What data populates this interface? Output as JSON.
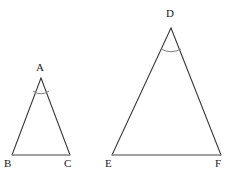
{
  "figure": {
    "background_color": "#ffffff",
    "side_color": "#3b3b3b",
    "base_color": "#808080",
    "arc_color": "#808080",
    "label_color": "#1a1a1a",
    "side_stroke_width": 1.1,
    "base_stroke_width": 1.6,
    "arc_stroke_width": 1.0
  },
  "triangles": [
    {
      "name": "triangle-abc",
      "apex_label": "A",
      "left_label": "B",
      "right_label": "C",
      "apex": {
        "x": 41,
        "y": 78
      },
      "left_vertex": {
        "x": 12,
        "y": 155
      },
      "right_vertex": {
        "x": 70,
        "y": 155
      },
      "angle_arc": {
        "start_x": 33,
        "start_y": 91,
        "end_x": 49,
        "end_y": 91,
        "radius": 13
      },
      "apex_label_pos": {
        "x": 36,
        "y": 62
      },
      "left_label_pos": {
        "x": 4,
        "y": 158
      },
      "right_label_pos": {
        "x": 64,
        "y": 158
      }
    },
    {
      "name": "triangle-def",
      "apex_label": "D",
      "left_label": "E",
      "right_label": "F",
      "apex": {
        "x": 171,
        "y": 28
      },
      "left_vertex": {
        "x": 112,
        "y": 155
      },
      "right_vertex": {
        "x": 221,
        "y": 155
      },
      "angle_arc": {
        "start_x": 161,
        "start_y": 49,
        "end_x": 181,
        "end_y": 49,
        "radius": 21
      },
      "apex_label_pos": {
        "x": 166,
        "y": 8
      },
      "left_label_pos": {
        "x": 105,
        "y": 158
      },
      "right_label_pos": {
        "x": 215,
        "y": 158
      }
    }
  ]
}
